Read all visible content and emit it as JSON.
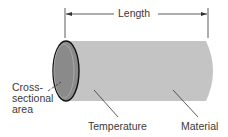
{
  "diagram": {
    "type": "cylinder-conductor",
    "labels": {
      "length": "Length",
      "cross_section_line1": "Cross-",
      "cross_section_line2": "sectional",
      "cross_section_line3": "area",
      "temperature": "Temperature",
      "material": "Material"
    },
    "colors": {
      "cylinder_body": "#c4c4c4",
      "cross_section_fill": "#8a8a8a",
      "outline": "#111111",
      "text": "#3a3a3a"
    }
  }
}
